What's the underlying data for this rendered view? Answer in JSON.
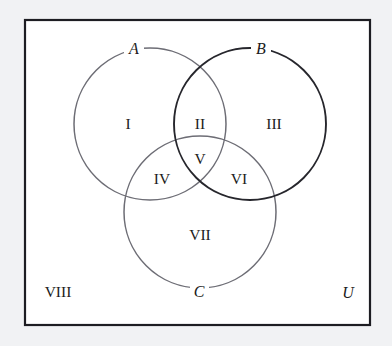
{
  "figure": {
    "type": "venn-diagram",
    "colors": {
      "page_background": "#f1f2f4",
      "universe_fill": "#ffffff",
      "universe_border": "#1d1d22",
      "circle_a_stroke": "#6d6d75",
      "circle_b_stroke": "#26262c",
      "circle_c_stroke": "#6d6d75",
      "text": "#1b1b20"
    }
  },
  "sets": [
    {
      "id": "A",
      "label": "A",
      "cx": 150,
      "cy": 124,
      "r": 76
    },
    {
      "id": "B",
      "label": "B",
      "cx": 250,
      "cy": 124,
      "r": 76
    },
    {
      "id": "C",
      "label": "C",
      "cx": 200,
      "cy": 212,
      "r": 76
    }
  ],
  "set_labels": {
    "a": "A",
    "b": "B",
    "c": "C"
  },
  "universe": {
    "label": "U",
    "outside_region_label": "VIII"
  },
  "regions": [
    {
      "id": "I",
      "label": "I",
      "meaning": "A only",
      "x": 128,
      "y": 129
    },
    {
      "id": "II",
      "label": "II",
      "meaning": "A and B only",
      "x": 200,
      "y": 129
    },
    {
      "id": "III",
      "label": "III",
      "meaning": "B only",
      "x": 274,
      "y": 129
    },
    {
      "id": "IV",
      "label": "IV",
      "meaning": "A and C only",
      "x": 162,
      "y": 184
    },
    {
      "id": "V",
      "label": "V",
      "meaning": "A and B and C",
      "x": 200,
      "y": 164
    },
    {
      "id": "VI",
      "label": "VI",
      "meaning": "B and C only",
      "x": 239,
      "y": 184
    },
    {
      "id": "VII",
      "label": "VII",
      "meaning": "C only",
      "x": 200,
      "y": 240
    },
    {
      "id": "VIII",
      "label": "VIII",
      "meaning": "outside A, B and C",
      "x": 58,
      "y": 297
    }
  ]
}
